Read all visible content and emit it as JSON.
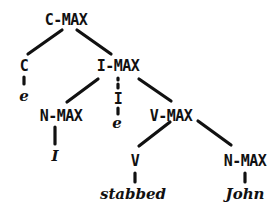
{
  "diagram": {
    "type": "syntax-tree",
    "line_color": "#111111",
    "nodes": {
      "root": {
        "label": "C-MAX"
      },
      "c": {
        "label": "C",
        "leaf": "e"
      },
      "imax": {
        "label": "I-MAX"
      },
      "nmax_left": {
        "label": "N-MAX",
        "leaf": "I"
      },
      "i": {
        "label": "I",
        "leaf": "e"
      },
      "vmax": {
        "label": "V-MAX"
      },
      "v": {
        "label": "V",
        "leaf": "stabbed"
      },
      "nmax_right": {
        "label": "N-MAX",
        "leaf": "John"
      }
    },
    "edges": [
      [
        "C-MAX",
        "C"
      ],
      [
        "C-MAX",
        "I-MAX"
      ],
      [
        "C",
        "e"
      ],
      [
        "I-MAX",
        "N-MAX"
      ],
      [
        "I-MAX",
        "I"
      ],
      [
        "I-MAX",
        "V-MAX"
      ],
      [
        "N-MAX",
        "I"
      ],
      [
        "I",
        "e"
      ],
      [
        "V-MAX",
        "V"
      ],
      [
        "V-MAX",
        "N-MAX"
      ],
      [
        "V",
        "stabbed"
      ],
      [
        "N-MAX",
        "John"
      ]
    ]
  }
}
